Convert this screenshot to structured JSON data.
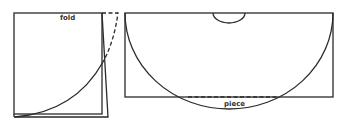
{
  "diagram": {
    "type": "sewing pattern illustration",
    "figures": [
      {
        "id": "folded-fabric",
        "label": "fold",
        "description": "Folded square of fabric with quarter-circle cut line and dashed fold-back edge"
      },
      {
        "id": "unfolded-piece",
        "label": "piece",
        "description": "Unfolded rectangle with large semicircular cut, small neck semicircle at top center, dashed line marking extra piece at bottom"
      }
    ],
    "colors": {
      "line": "#2a2a2a",
      "background": "#ffffff",
      "text": "#333333"
    }
  }
}
